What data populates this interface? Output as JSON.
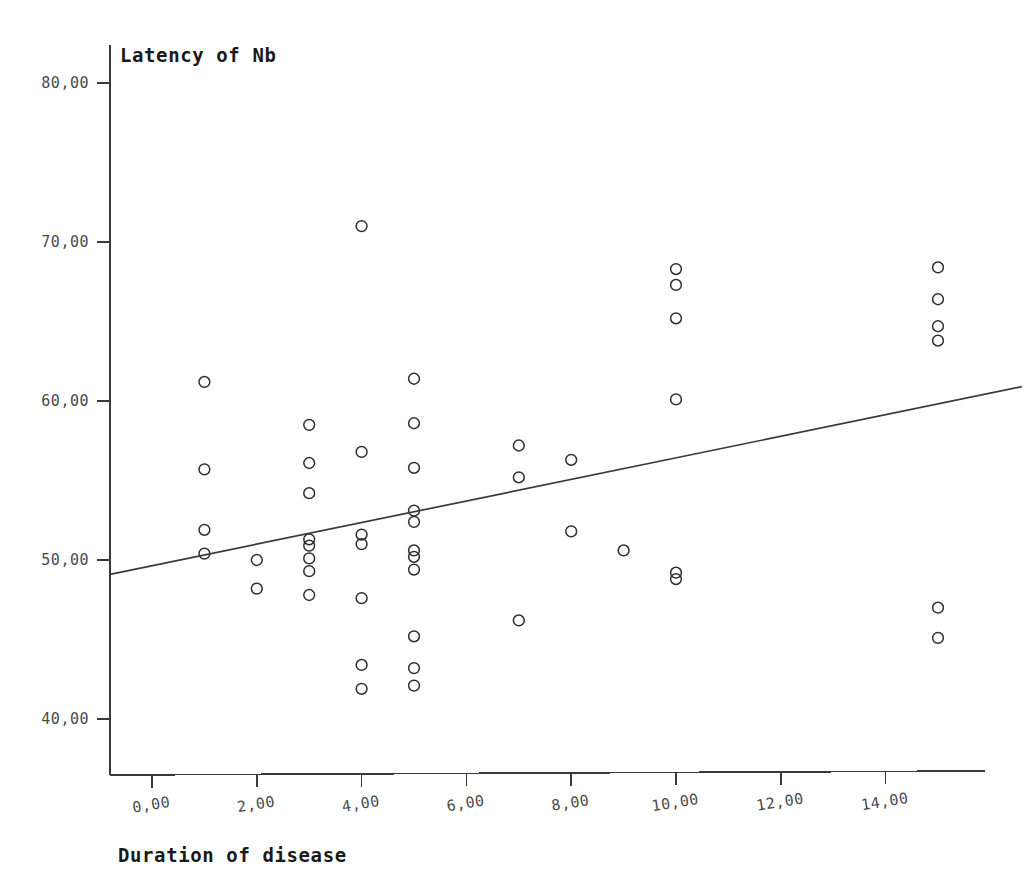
{
  "chart_data": {
    "type": "scatter",
    "title": "",
    "ylabel": "Latency of Nb",
    "xlabel": "Duration of disease",
    "xlim": [
      -1,
      16
    ],
    "ylim": [
      37.5,
      81.5
    ],
    "grid": false,
    "legend": "none",
    "x_ticks": [
      0,
      2,
      4,
      6,
      8,
      10,
      12,
      14
    ],
    "x_tick_labels": [
      "0,00",
      "2,00",
      "4,00",
      "6,00",
      "8,00",
      "10,00",
      "12,00",
      "14,00"
    ],
    "y_ticks": [
      40,
      50,
      60,
      70,
      80
    ],
    "y_tick_labels": [
      "40,00",
      "50,00",
      "60,00",
      "70,00",
      "80,00"
    ],
    "marker": "open-circle",
    "marker_color": "#2e2e2e",
    "points": [
      {
        "x": 1,
        "y": 61.2
      },
      {
        "x": 1,
        "y": 55.7
      },
      {
        "x": 1,
        "y": 51.9
      },
      {
        "x": 1,
        "y": 50.4
      },
      {
        "x": 2,
        "y": 50.0
      },
      {
        "x": 2,
        "y": 48.2
      },
      {
        "x": 3,
        "y": 58.5
      },
      {
        "x": 3,
        "y": 56.1
      },
      {
        "x": 3,
        "y": 54.2
      },
      {
        "x": 3,
        "y": 51.3
      },
      {
        "x": 3,
        "y": 50.9
      },
      {
        "x": 3,
        "y": 50.1
      },
      {
        "x": 3,
        "y": 49.3
      },
      {
        "x": 3,
        "y": 47.8
      },
      {
        "x": 4,
        "y": 71.0
      },
      {
        "x": 4,
        "y": 56.8
      },
      {
        "x": 4,
        "y": 51.6
      },
      {
        "x": 4,
        "y": 51.0
      },
      {
        "x": 4,
        "y": 47.6
      },
      {
        "x": 4,
        "y": 43.4
      },
      {
        "x": 4,
        "y": 41.9
      },
      {
        "x": 5,
        "y": 61.4
      },
      {
        "x": 5,
        "y": 58.6
      },
      {
        "x": 5,
        "y": 55.8
      },
      {
        "x": 5,
        "y": 53.1
      },
      {
        "x": 5,
        "y": 52.4
      },
      {
        "x": 5,
        "y": 50.6
      },
      {
        "x": 5,
        "y": 50.2
      },
      {
        "x": 5,
        "y": 49.4
      },
      {
        "x": 5,
        "y": 45.2
      },
      {
        "x": 5,
        "y": 43.2
      },
      {
        "x": 5,
        "y": 42.1
      },
      {
        "x": 7,
        "y": 57.2
      },
      {
        "x": 7,
        "y": 55.2
      },
      {
        "x": 7,
        "y": 46.2
      },
      {
        "x": 8,
        "y": 56.3
      },
      {
        "x": 8,
        "y": 51.8
      },
      {
        "x": 9,
        "y": 50.6
      },
      {
        "x": 10,
        "y": 68.3
      },
      {
        "x": 10,
        "y": 67.3
      },
      {
        "x": 10,
        "y": 65.2
      },
      {
        "x": 10,
        "y": 60.1
      },
      {
        "x": 10,
        "y": 49.2
      },
      {
        "x": 10,
        "y": 48.8
      },
      {
        "x": 15,
        "y": 68.4
      },
      {
        "x": 15,
        "y": 66.4
      },
      {
        "x": 15,
        "y": 64.7
      },
      {
        "x": 15,
        "y": 63.8
      },
      {
        "x": 15,
        "y": 47.0
      },
      {
        "x": 15,
        "y": 45.1
      }
    ],
    "fit_line": {
      "type": "linear-regression",
      "x_start": -0.8,
      "y_start": 49.1,
      "x_end": 16.6,
      "y_end": 60.9
    }
  }
}
